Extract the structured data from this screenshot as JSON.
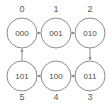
{
  "diagram": {
    "type": "directed-cycle-graph",
    "canvas": {
      "width": 112,
      "height": 105
    },
    "colors": {
      "background": "#ffffff",
      "node_stroke": "#8c8c8c",
      "node_fill": "#ffffff",
      "node_text": "#4a4a4a",
      "index_text": "#5a5a5a",
      "edge": "#8c8c8c"
    },
    "nodes": [
      {
        "id": "n0",
        "label": "000",
        "index": "0",
        "cx": 22,
        "cy": 33,
        "r": 15,
        "index_x": 22,
        "index_y": 9
      },
      {
        "id": "n1",
        "label": "001",
        "index": "1",
        "cx": 56,
        "cy": 33,
        "r": 15,
        "index_x": 56,
        "index_y": 9
      },
      {
        "id": "n2",
        "label": "010",
        "index": "2",
        "cx": 90,
        "cy": 33,
        "r": 15,
        "index_x": 90,
        "index_y": 9
      },
      {
        "id": "n3",
        "label": "011",
        "index": "3",
        "cx": 90,
        "cy": 76,
        "r": 15,
        "index_x": 90,
        "index_y": 97
      },
      {
        "id": "n4",
        "label": "100",
        "index": "4",
        "cx": 56,
        "cy": 76,
        "r": 15,
        "index_x": 56,
        "index_y": 97
      },
      {
        "id": "n5",
        "label": "101",
        "index": "5",
        "cx": 22,
        "cy": 76,
        "r": 15,
        "index_x": 22,
        "index_y": 97
      }
    ],
    "edges": [
      {
        "from": "000",
        "to": "001",
        "direction": "right"
      },
      {
        "from": "001",
        "to": "010",
        "direction": "right"
      },
      {
        "from": "010",
        "to": "011",
        "direction": "down"
      },
      {
        "from": "011",
        "to": "100",
        "direction": "left"
      },
      {
        "from": "100",
        "to": "101",
        "direction": "left"
      },
      {
        "from": "101",
        "to": "000",
        "direction": "up"
      }
    ]
  }
}
